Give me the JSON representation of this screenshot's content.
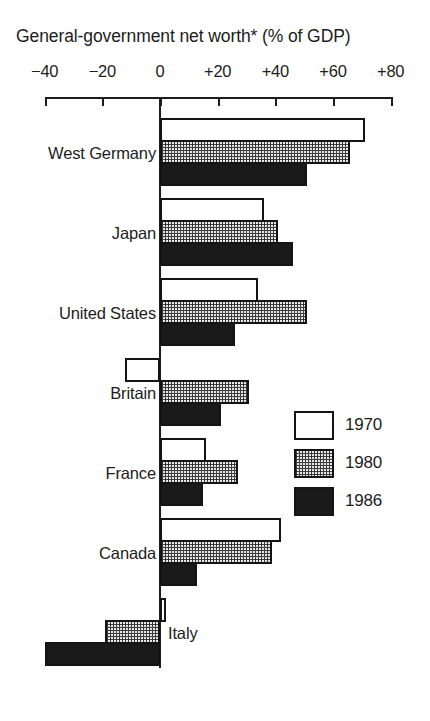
{
  "chart_data": {
    "type": "bar",
    "orientation": "horizontal",
    "title": "General-government net worth* (% of GDP)",
    "xlabel": "",
    "ylabel": "",
    "xlim": [
      -40,
      80
    ],
    "grid": false,
    "legend_position": "middle-right",
    "axis_ticks": [
      {
        "value": -40,
        "label": "−40"
      },
      {
        "value": -20,
        "label": "−20"
      },
      {
        "value": 0,
        "label": "0"
      },
      {
        "value": 20,
        "label": "+20"
      },
      {
        "value": 40,
        "label": "+40"
      },
      {
        "value": 60,
        "label": "+60"
      },
      {
        "value": 80,
        "label": "+80"
      }
    ],
    "categories": [
      "West Germany",
      "Japan",
      "United States",
      "Britain",
      "France",
      "Canada",
      "Italy"
    ],
    "series": [
      {
        "name": "1970",
        "fill": "white",
        "values": [
          71,
          36,
          34,
          -12,
          16,
          42,
          2
        ]
      },
      {
        "name": "1980",
        "fill": "stipple",
        "values": [
          66,
          41,
          51,
          31,
          27,
          39,
          -19
        ]
      },
      {
        "name": "1986",
        "fill": "black",
        "values": [
          51,
          46,
          26,
          21,
          15,
          13,
          -40
        ]
      }
    ],
    "legend": [
      {
        "label": "1970",
        "fill": "white"
      },
      {
        "label": "1980",
        "fill": "stipple"
      },
      {
        "label": "1986",
        "fill": "black"
      }
    ]
  },
  "layout": {
    "plot_left_px": 46,
    "plot_right_px": 392,
    "zero_px": 160,
    "px_per_unit": 2.8833,
    "axis_line_y_px": 97,
    "tick_height_px": 9,
    "bar_height_px": 22,
    "group_start_y_px": 118,
    "group_pitch_px": 80,
    "zero_line_top_px": 97,
    "zero_line_bottom_px": 668
  }
}
